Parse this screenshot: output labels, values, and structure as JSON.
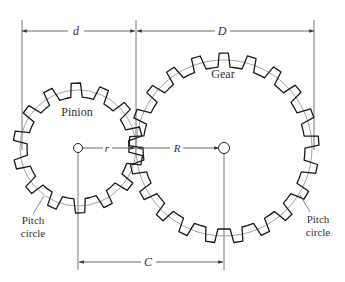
{
  "diagram": {
    "colors": {
      "gear_outline": "#1a1a1a",
      "pitch_circle": "#999999",
      "dimension": "#444444",
      "text": "#333333"
    },
    "pinion": {
      "label": "Pinion",
      "center": [
        78,
        148
      ],
      "pitch_radius": 58,
      "teeth": 14,
      "pitch_label": "Pitch circle",
      "pitch_label_line1": "Pitch",
      "pitch_label_line2": "circle"
    },
    "gear": {
      "label": "Gear",
      "center": [
        224,
        148
      ],
      "pitch_radius": 88,
      "teeth": 21,
      "pitch_label": "Pitch circle",
      "pitch_label_line1": "Pitch",
      "pitch_label_line2": "circle"
    },
    "dimensions": {
      "d": {
        "label": "d",
        "meaning": "pinion pitch diameter"
      },
      "D": {
        "label": "D",
        "meaning": "gear pitch diameter"
      },
      "r": {
        "label": "r",
        "meaning": "pinion pitch radius"
      },
      "R": {
        "label": "R",
        "meaning": "gear pitch radius"
      },
      "C": {
        "label": "C",
        "meaning": "center distance"
      }
    }
  }
}
